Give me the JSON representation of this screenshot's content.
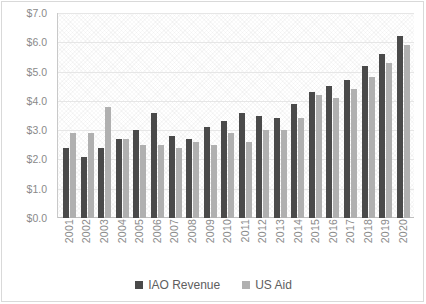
{
  "chart_data": {
    "type": "bar",
    "title": "",
    "xlabel": "",
    "ylabel": "",
    "ylim": [
      0,
      7
    ],
    "ytick_labels": [
      "$7.0",
      "$6.0",
      "$5.0",
      "$4.0",
      "$3.0",
      "$2.0",
      "$1.0",
      "$0.0"
    ],
    "ytick_values": [
      7,
      6,
      5,
      4,
      3,
      2,
      1,
      0
    ],
    "grid": true,
    "legend_position": "bottom",
    "categories": [
      "2001",
      "2002",
      "2003",
      "2004",
      "2005",
      "2006",
      "2007",
      "2008",
      "2009",
      "2010",
      "2011",
      "2012",
      "2013",
      "2014",
      "2015",
      "2016",
      "2017",
      "2018",
      "2019",
      "2020"
    ],
    "series": [
      {
        "name": "IAO Revenue",
        "color": "#4a4a4a",
        "values": [
          2.4,
          2.1,
          2.4,
          2.7,
          3.0,
          3.6,
          2.8,
          2.7,
          3.1,
          3.3,
          3.6,
          3.5,
          3.4,
          3.9,
          4.3,
          4.5,
          4.7,
          5.2,
          5.6,
          6.2
        ]
      },
      {
        "name": "US Aid",
        "color": "#b0b0b0",
        "values": [
          2.9,
          2.9,
          3.8,
          2.7,
          2.5,
          2.5,
          2.4,
          2.6,
          2.5,
          2.9,
          2.6,
          3.0,
          3.0,
          3.4,
          4.2,
          4.1,
          4.4,
          4.8,
          5.3,
          5.9
        ]
      }
    ]
  },
  "legend": {
    "items": [
      {
        "label": "IAO Revenue"
      },
      {
        "label": "US Aid"
      }
    ]
  }
}
